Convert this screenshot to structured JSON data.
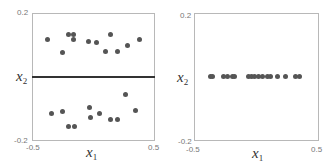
{
  "chart_data": [
    {
      "type": "scatter",
      "title": "",
      "xlabel": "x1",
      "ylabel": "x2",
      "xlim": [
        -0.5,
        0.5
      ],
      "ylim": [
        -0.2,
        0.2
      ],
      "x_ticks": [
        "-0.5",
        "0.5"
      ],
      "y_ticks": [
        "0.2",
        "-0.2"
      ],
      "grid": false,
      "legend": null,
      "annotations": [
        {
          "type": "hline",
          "y": 0.0,
          "color": "#333333"
        }
      ],
      "series": [
        {
          "name": "points",
          "color": "#555555",
          "points": [
            [
              -0.37,
              0.115
            ],
            [
              -0.25,
              0.077
            ],
            [
              -0.2,
              0.131
            ],
            [
              -0.16,
              0.131
            ],
            [
              -0.16,
              0.115
            ],
            [
              -0.04,
              0.109
            ],
            [
              0.03,
              0.106
            ],
            [
              0.14,
              0.131
            ],
            [
              0.1,
              0.08
            ],
            [
              0.2,
              0.08
            ],
            [
              0.28,
              0.099
            ],
            [
              0.38,
              0.115
            ],
            [
              -0.34,
              -0.118
            ],
            [
              -0.25,
              -0.109
            ],
            [
              -0.2,
              -0.159
            ],
            [
              -0.15,
              -0.159
            ],
            [
              -0.03,
              -0.099
            ],
            [
              -0.02,
              -0.128
            ],
            [
              0.05,
              -0.118
            ],
            [
              0.14,
              -0.137
            ],
            [
              0.2,
              -0.137
            ],
            [
              0.27,
              -0.058
            ],
            [
              0.35,
              -0.106
            ]
          ]
        }
      ]
    },
    {
      "type": "scatter",
      "title": "",
      "xlabel": "x1",
      "ylabel": "x2",
      "xlim": [
        -0.5,
        0.5
      ],
      "ylim": [
        -0.2,
        0.2
      ],
      "x_ticks": [
        "-0.5",
        "0.5"
      ],
      "y_ticks": [
        "0.2",
        "-0.2"
      ],
      "grid": false,
      "legend": null,
      "series": [
        {
          "name": "projected points",
          "color": "#555555",
          "points": [
            [
              -0.37,
              0
            ],
            [
              -0.35,
              0
            ],
            [
              -0.26,
              0
            ],
            [
              -0.23,
              0
            ],
            [
              -0.19,
              0
            ],
            [
              -0.17,
              0
            ],
            [
              -0.06,
              0
            ],
            [
              -0.04,
              0
            ],
            [
              -0.01,
              0
            ],
            [
              0.02,
              0
            ],
            [
              0.05,
              0
            ],
            [
              0.09,
              0
            ],
            [
              0.12,
              0
            ],
            [
              0.17,
              0
            ],
            [
              0.24,
              0
            ],
            [
              0.32,
              0
            ],
            [
              0.35,
              0
            ]
          ]
        }
      ]
    }
  ],
  "labels": {
    "x_main": "x",
    "x_sub": "1",
    "y_main": "x",
    "y_sub": "2",
    "y_top": "0.2",
    "y_bottom": "-0.2",
    "x_left": "-0.5",
    "x_right": "0.5"
  }
}
